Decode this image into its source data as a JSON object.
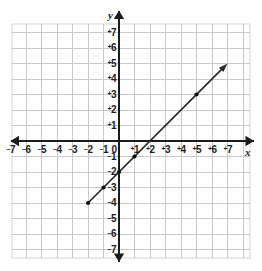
{
  "figure": {
    "kind": "coordinate-plane-graph",
    "width": 262,
    "height": 271,
    "background_color": "#ffffff"
  },
  "colors": {
    "grid": "#c9c9cd",
    "grid_minor": "#dcdce0",
    "axis": "#1c1c1c",
    "line": "#2a2a2a",
    "point": "#111111",
    "label": "#1c1c1c",
    "frame": "#d5d5d9"
  },
  "axes": {
    "x_label": "x",
    "y_label": "y",
    "origin_label": "0",
    "x_range": [
      -7.7,
      8.7
    ],
    "y_range": [
      -8.4,
      8.4
    ],
    "unit_px": 15.5,
    "origin_px": {
      "x": 119,
      "y": 141
    },
    "grid": true,
    "grid_step": 1,
    "arrowheads": [
      "left",
      "right",
      "up",
      "down"
    ],
    "x_ticks": [
      {
        "value": -7,
        "text": "7",
        "sign": "−"
      },
      {
        "value": -6,
        "text": "6",
        "sign": "−"
      },
      {
        "value": -5,
        "text": "5",
        "sign": "−"
      },
      {
        "value": -4,
        "text": "4",
        "sign": "−"
      },
      {
        "value": -3,
        "text": "3",
        "sign": "−"
      },
      {
        "value": -2,
        "text": "2",
        "sign": "−"
      },
      {
        "value": -1,
        "text": "1",
        "sign": "−"
      },
      {
        "value": 1,
        "text": "1",
        "sign": "+"
      },
      {
        "value": 2,
        "text": "2",
        "sign": "+"
      },
      {
        "value": 3,
        "text": "3",
        "sign": "+"
      },
      {
        "value": 4,
        "text": "4",
        "sign": "+"
      },
      {
        "value": 5,
        "text": "5",
        "sign": "+"
      },
      {
        "value": 6,
        "text": "6",
        "sign": "+"
      },
      {
        "value": 7,
        "text": "7",
        "sign": "+"
      }
    ],
    "y_ticks": [
      {
        "value": 7,
        "text": "7",
        "sign": "+"
      },
      {
        "value": 6,
        "text": "6",
        "sign": "+"
      },
      {
        "value": 5,
        "text": "5",
        "sign": "+"
      },
      {
        "value": 4,
        "text": "4",
        "sign": "+"
      },
      {
        "value": 3,
        "text": "3",
        "sign": "+"
      },
      {
        "value": 2,
        "text": "2",
        "sign": "+"
      },
      {
        "value": 1,
        "text": "1",
        "sign": "+"
      },
      {
        "value": -1,
        "text": "1",
        "sign": "−"
      },
      {
        "value": -2,
        "text": "2",
        "sign": "−"
      },
      {
        "value": -3,
        "text": "3",
        "sign": "−"
      },
      {
        "value": -4,
        "text": "4",
        "sign": "−"
      },
      {
        "value": -5,
        "text": "5",
        "sign": "−"
      },
      {
        "value": -6,
        "text": "6",
        "sign": "−"
      },
      {
        "value": -7,
        "text": "7",
        "sign": "−"
      }
    ]
  },
  "chart_data": {
    "type": "line",
    "title": "",
    "subtitle": "",
    "xlabel": "x",
    "ylabel": "y",
    "xlim": [
      -7.7,
      8.7
    ],
    "ylim": [
      -8.4,
      8.4
    ],
    "grid": true,
    "legend": "none",
    "annotations": [],
    "series": [
      {
        "name": "y = x − 2",
        "equation": "y = x - 2",
        "slope": 1,
        "intercept": -2,
        "x_intercept": 2,
        "style": "solid",
        "color": "#2a2a2a",
        "start": {
          "x": -2,
          "y": -4,
          "cap": "dot"
        },
        "end": {
          "x": 7,
          "y": 5,
          "cap": "arrow"
        },
        "x": [
          -2,
          -1,
          0,
          1,
          5
        ],
        "values": [
          -4,
          -3,
          -2,
          -1,
          3
        ],
        "points": [
          {
            "x": -2,
            "y": -4,
            "marker": "dot"
          },
          {
            "x": -1,
            "y": -3,
            "marker": "dot"
          },
          {
            "x": 0,
            "y": -2,
            "marker": "dot"
          },
          {
            "x": 1,
            "y": -1,
            "marker": "dot"
          },
          {
            "x": 5,
            "y": 3,
            "marker": "dot"
          }
        ]
      }
    ]
  }
}
